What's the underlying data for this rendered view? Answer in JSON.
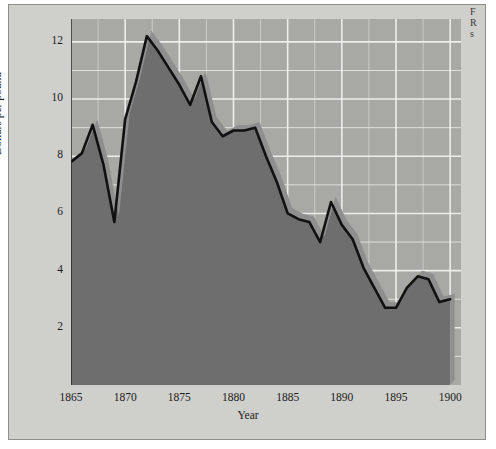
{
  "figure": {
    "background_color": "#cfcfcb",
    "plot_background_color": "#a8a8a4",
    "area_fill_color": "#6e6e6e",
    "ribbon_color": "#8f8f8f",
    "line_color": "#111111",
    "grid_color": "#f0f0ee"
  },
  "chart_data": {
    "type": "area",
    "title": "",
    "subtitle": "",
    "xlabel": "Year",
    "ylabel": "Dollars per pound",
    "xlim": [
      1865,
      1901
    ],
    "ylim": [
      0,
      12.8
    ],
    "xticks": [
      1865,
      1870,
      1875,
      1880,
      1885,
      1890,
      1895,
      1900
    ],
    "yticks": [
      2,
      4,
      6,
      8,
      10,
      12
    ],
    "grid": "horizontal-and-vertical minor gridlines at every 1 unit (y) and every 1 year-group (x)",
    "legend": "none",
    "legend_position": "none",
    "x": [
      1865,
      1866,
      1867,
      1868,
      1869,
      1870,
      1871,
      1872,
      1873,
      1874,
      1875,
      1876,
      1877,
      1878,
      1879,
      1880,
      1881,
      1882,
      1883,
      1884,
      1885,
      1886,
      1887,
      1888,
      1889,
      1890,
      1891,
      1892,
      1893,
      1894,
      1895,
      1896,
      1897,
      1898,
      1899,
      1900
    ],
    "values": [
      7.8,
      8.1,
      9.1,
      7.7,
      5.7,
      9.3,
      10.6,
      12.2,
      11.7,
      11.1,
      10.5,
      9.8,
      10.8,
      9.2,
      8.7,
      8.9,
      8.9,
      9.0,
      8.0,
      7.1,
      6.0,
      5.8,
      5.7,
      5.0,
      6.4,
      5.6,
      5.1,
      4.1,
      3.4,
      2.7,
      2.7,
      3.4,
      3.8,
      3.7,
      2.9,
      3.0
    ],
    "series": [
      {
        "name": "Dollars per pound",
        "values": [
          7.8,
          8.1,
          9.1,
          7.7,
          5.7,
          9.3,
          10.6,
          12.2,
          11.7,
          11.1,
          10.5,
          9.8,
          10.8,
          9.2,
          8.7,
          8.9,
          8.9,
          9.0,
          8.0,
          7.1,
          6.0,
          5.8,
          5.7,
          5.0,
          6.4,
          5.6,
          5.1,
          4.1,
          3.4,
          2.7,
          2.7,
          3.4,
          3.8,
          3.7,
          2.9,
          3.0
        ]
      }
    ]
  },
  "axis": {
    "y_tick_labels": [
      "12",
      "10",
      "8",
      "6",
      "4",
      "2"
    ],
    "x_tick_labels": [
      "1865",
      "1870",
      "1875",
      "1880",
      "1885",
      "1890",
      "1895",
      "1900"
    ],
    "y_axis_title": "Dollars per pound",
    "x_axis_title": "Year"
  },
  "margin_note": {
    "line1": "F",
    "line2": "R",
    "line3": "s"
  }
}
